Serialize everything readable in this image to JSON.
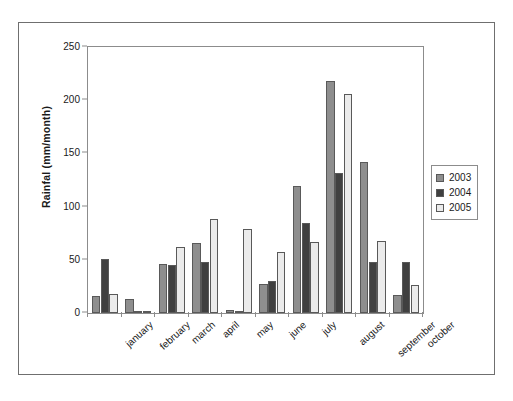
{
  "chart_data": {
    "type": "bar",
    "title": "",
    "xlabel": "",
    "ylabel": "Rainfal (mm/month)",
    "ylim": [
      0,
      250
    ],
    "yticks": [
      0,
      50,
      100,
      150,
      200,
      250
    ],
    "grid": false,
    "legend_position": "right",
    "categories": [
      "january",
      "february",
      "march",
      "april",
      "may",
      "june",
      "july",
      "august",
      "september",
      "october"
    ],
    "series": [
      {
        "name": "2003",
        "color": "#8e8e8e",
        "values": [
          16,
          13,
          46,
          66,
          3,
          27,
          119,
          218,
          142,
          17
        ]
      },
      {
        "name": "2004",
        "color": "#404040",
        "values": [
          51,
          1,
          45,
          48,
          0,
          30,
          85,
          132,
          48,
          48
        ]
      },
      {
        "name": "2005",
        "color": "#ebebeb",
        "values": [
          18,
          2,
          62,
          88,
          79,
          57,
          67,
          206,
          68,
          26
        ]
      }
    ]
  },
  "legend": {
    "items": [
      {
        "label": "2003"
      },
      {
        "label": "2004"
      },
      {
        "label": "2005"
      }
    ]
  }
}
